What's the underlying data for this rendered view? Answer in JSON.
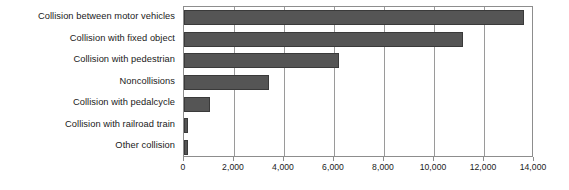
{
  "chart_data": {
    "type": "bar",
    "orientation": "horizontal",
    "title": "",
    "subtitle": "",
    "xlabel": "",
    "ylabel": "",
    "xlim": [
      0,
      14000
    ],
    "grid": true,
    "legend": false,
    "legend_position": "none",
    "bar_color": "#555555",
    "bar_edge_color": "#3a3a3a",
    "gridline_color": "#9a9a9a",
    "axis_color": "#8d8d8d",
    "text_color": "#1a1a1a",
    "background_color": "#ffffff",
    "categories": [
      "Collision between motor vehicles",
      "Collision with fixed object",
      "Collision with pedestrian",
      "Noncollisions",
      "Collision with pedalcycle",
      "Collision with railroad train",
      "Other collision"
    ],
    "values": [
      13600,
      11160,
      6200,
      3400,
      1040,
      160,
      160
    ],
    "xticks": [
      0,
      2000,
      4000,
      6000,
      8000,
      10000,
      12000,
      14000
    ],
    "xtick_labels": [
      "0",
      "2,000",
      "4,000",
      "6,000",
      "8,000",
      "10,000",
      "12,000",
      "14,000"
    ]
  }
}
